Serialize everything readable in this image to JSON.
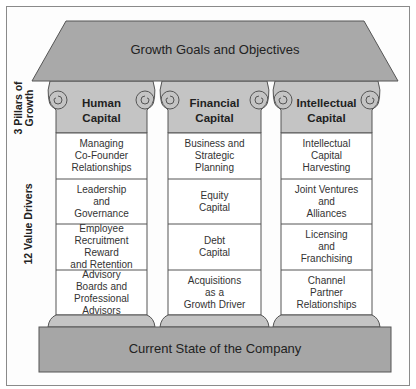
{
  "roof": {
    "label": "Growth Goals and Objectives"
  },
  "base": {
    "label": "Current State of the Company"
  },
  "side_labels": {
    "pillars": "3 Pillars of Growth",
    "pillars_line1": "3 Pillars of",
    "pillars_line2": "Growth",
    "drivers": "12 Value Drivers"
  },
  "pillars": [
    {
      "title_line1": "Human",
      "title_line2": "Capital",
      "drivers": [
        "Managing\nCo-Founder\nRelationships",
        "Leadership\nand\nGovernance",
        "Employee\nRecruitment\nReward\nand Retention",
        "Advisory\nBoards and\nProfessional\nAdvisors"
      ]
    },
    {
      "title_line1": "Financial",
      "title_line2": "Capital",
      "drivers": [
        "Business and\nStrategic\nPlanning",
        "Equity\nCapital",
        "Debt\nCapital",
        "Acquisitions\nas a\nGrowth Driver"
      ]
    },
    {
      "title_line1": "Intellectual",
      "title_line2": "Capital",
      "drivers": [
        "Intellectual\nCapital\nHarvesting",
        "Joint Ventures\nand\nAlliances",
        "Licensing\nand\nFranchising",
        "Channel\nPartner\nRelationships"
      ]
    }
  ],
  "colors": {
    "roof_fill": "#a9a9a9",
    "capital_fill": "#c4c4c4",
    "base_fill": "#a6a6a6",
    "stroke": "#555555",
    "cell_fill": "#ffffff"
  }
}
